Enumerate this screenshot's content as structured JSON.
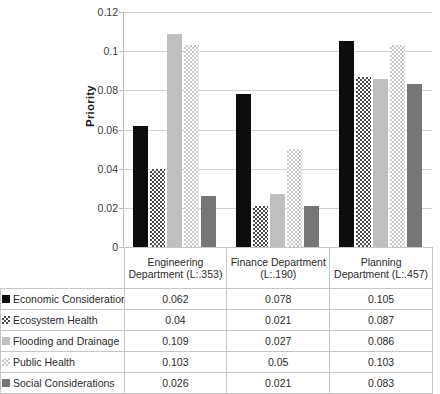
{
  "chart_data": {
    "type": "bar",
    "title": "",
    "subtitle": "",
    "xlabel": "",
    "ylabel": "Priority",
    "ylim": [
      0,
      0.12
    ],
    "ytick_step": 0.02,
    "ytick_labels": [
      "0.12",
      "0.1",
      "0.08",
      "0.06",
      "0.04",
      "0.02",
      "0"
    ],
    "ytick_values": [
      0.12,
      0.1,
      0.08,
      0.06,
      0.04,
      0.02,
      0
    ],
    "grid": "horizontal",
    "legend_position": "data-table-left-column",
    "categories": [
      "Engineering Department (L:.353)",
      "Finance Department (L:.190)",
      "Planning Department (L:.457)"
    ],
    "series": [
      {
        "name": "Economic Considerations",
        "values": [
          0.062,
          0.078,
          0.105
        ],
        "value_labels": [
          "0.062",
          "0.078",
          "0.105"
        ],
        "pattern": "solid",
        "color": "#0d0d0d"
      },
      {
        "name": "Ecosystem Health",
        "values": [
          0.04,
          0.021,
          0.087
        ],
        "value_labels": [
          "0.04",
          "0.021",
          "0.087"
        ],
        "pattern": "checker-dark",
        "color": "#4a4a4a"
      },
      {
        "name": "Flooding and Drainage",
        "values": [
          0.109,
          0.027,
          0.086
        ],
        "value_labels": [
          "0.109",
          "0.027",
          "0.086"
        ],
        "pattern": "solid",
        "color": "#bfbfbf"
      },
      {
        "name": "Public Health",
        "values": [
          0.103,
          0.05,
          0.103
        ],
        "value_labels": [
          "0.103",
          "0.05",
          "0.103"
        ],
        "pattern": "checker-light",
        "color": "#c9c9c9"
      },
      {
        "name": "Social Considerations",
        "values": [
          0.026,
          0.021,
          0.083
        ],
        "value_labels": [
          "0.026",
          "0.021",
          "0.083"
        ],
        "pattern": "solid",
        "color": "#767676"
      }
    ]
  },
  "table": {
    "corner_label": "",
    "column_headers": [
      "Engineering Department (L:.353)",
      "Finance Department (L:.190)",
      "Planning Department (L:.457)"
    ],
    "rows": [
      {
        "label": "Economic Considerations",
        "values": [
          "0.062",
          "0.078",
          "0.105"
        ]
      },
      {
        "label": "Ecosystem Health",
        "values": [
          "0.04",
          "0.021",
          "0.087"
        ]
      },
      {
        "label": "Flooding and Drainage",
        "values": [
          "0.109",
          "0.027",
          "0.086"
        ]
      },
      {
        "label": "Public Health",
        "values": [
          "0.103",
          "0.05",
          "0.103"
        ]
      },
      {
        "label": "Social Considerations",
        "values": [
          "0.026",
          "0.021",
          "0.083"
        ]
      }
    ]
  }
}
